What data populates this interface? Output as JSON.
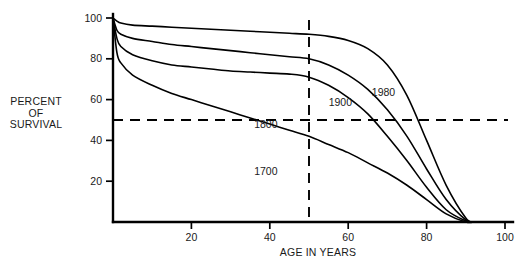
{
  "labels": {
    "y_axis_title_line1": "PERCENT",
    "y_axis_title_line2": "OF",
    "y_axis_title_line3": "SURVIVAL",
    "x_axis_title": "AGE IN YEARS"
  },
  "chart_data": {
    "type": "line",
    "title": "",
    "subtitle": "",
    "xlabel": "AGE IN YEARS",
    "ylabel": "PERCENT OF SURVIVAL",
    "xlim": [
      0,
      100
    ],
    "ylim": [
      0,
      100
    ],
    "xticks": [
      20,
      40,
      60,
      80,
      100
    ],
    "yticks": [
      20,
      40,
      60,
      80,
      100
    ],
    "xtick_labels": [
      "20",
      "40",
      "60",
      "80",
      "100"
    ],
    "ytick_labels": [
      "20",
      "40",
      "60",
      "80",
      "100"
    ],
    "grid": false,
    "legend": "inline-curve-labels",
    "annotations": [
      {
        "text": "1980",
        "x": 69,
        "y": 62,
        "series": "1980"
      },
      {
        "text": "1900",
        "x": 58,
        "y": 57,
        "series": "1900"
      },
      {
        "text": "1800",
        "x": 39,
        "y": 46,
        "series": "1800"
      },
      {
        "text": "1700",
        "x": 39,
        "y": 23,
        "series": "1700"
      }
    ],
    "reference_lines": [
      {
        "orientation": "horizontal",
        "value": 50,
        "style": "dashed",
        "axis": "y"
      },
      {
        "orientation": "vertical",
        "value": 50,
        "style": "dashed",
        "axis": "x"
      }
    ],
    "x": [
      0,
      1,
      2,
      5,
      10,
      15,
      20,
      25,
      30,
      35,
      40,
      45,
      50,
      55,
      60,
      65,
      70,
      75,
      80,
      85,
      90,
      92
    ],
    "series": [
      {
        "name": "1980",
        "values": [
          100,
          98.5,
          97.5,
          96.5,
          96,
          95.5,
          95,
          94.5,
          94,
          93.5,
          93,
          92.5,
          92,
          91,
          89,
          85,
          77,
          62,
          40,
          18,
          2,
          0
        ]
      },
      {
        "name": "1900",
        "values": [
          100,
          94,
          92,
          90,
          88.5,
          87,
          86,
          85,
          84,
          83,
          82,
          81,
          80,
          77,
          72,
          65,
          55,
          42,
          26,
          11,
          1,
          0
        ]
      },
      {
        "name": "1800",
        "values": [
          100,
          90,
          86,
          82,
          79,
          77,
          76,
          75,
          74,
          73.5,
          73,
          72.5,
          71,
          67,
          61,
          53,
          42,
          30,
          17,
          6,
          0.5,
          0
        ]
      },
      {
        "name": "1700",
        "values": [
          100,
          83,
          78,
          72,
          67,
          63,
          60,
          57,
          54,
          51,
          48,
          45,
          42,
          38,
          34,
          29,
          24,
          18,
          11,
          4,
          0,
          0
        ]
      }
    ]
  }
}
